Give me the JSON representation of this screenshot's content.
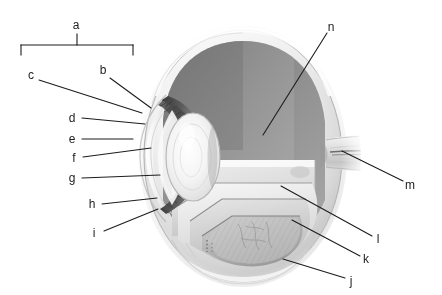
{
  "figure": {
    "style": "grayscale anatomical illustration with lettered leader lines",
    "background_color": "#ffffff",
    "line_color": "#1d1d1d",
    "text_color": "#1d1d1d",
    "width": 442,
    "height": 295
  },
  "bracket": {
    "name": "a",
    "label": "a",
    "label_x": 76,
    "label_y": 25,
    "left_x": 21,
    "right_x": 133,
    "bar_y": 45,
    "tick_depth": 10,
    "stem_top": 34
  },
  "labels": [
    {
      "id": "a",
      "text": "a",
      "x": 76,
      "y": 25
    },
    {
      "id": "b",
      "text": "b",
      "x": 103,
      "y": 70
    },
    {
      "id": "c",
      "text": "c",
      "x": 31,
      "y": 75
    },
    {
      "id": "d",
      "text": "d",
      "x": 72,
      "y": 118
    },
    {
      "id": "e",
      "text": "e",
      "x": 72,
      "y": 139
    },
    {
      "id": "f",
      "text": "f",
      "x": 74,
      "y": 158
    },
    {
      "id": "g",
      "text": "g",
      "x": 72,
      "y": 178
    },
    {
      "id": "h",
      "text": "h",
      "x": 92,
      "y": 204
    },
    {
      "id": "i",
      "text": "i",
      "x": 94,
      "y": 233
    },
    {
      "id": "j",
      "text": "j",
      "x": 351,
      "y": 281
    },
    {
      "id": "k",
      "text": "k",
      "x": 366,
      "y": 259
    },
    {
      "id": "l",
      "text": "l",
      "x": 378,
      "y": 239
    },
    {
      "id": "m",
      "text": "m",
      "x": 410,
      "y": 185
    },
    {
      "id": "n",
      "text": "n",
      "x": 331,
      "y": 27
    }
  ],
  "leader_lines": [
    {
      "id": "b",
      "x1": 110,
      "y1": 78,
      "x2": 151,
      "y2": 108
    },
    {
      "id": "c",
      "x1": 39,
      "y1": 80,
      "x2": 142,
      "y2": 113
    },
    {
      "id": "d",
      "x1": 82,
      "y1": 118,
      "x2": 145,
      "y2": 124
    },
    {
      "id": "e",
      "x1": 82,
      "y1": 139,
      "x2": 133,
      "y2": 139
    },
    {
      "id": "f",
      "x1": 83,
      "y1": 157,
      "x2": 151,
      "y2": 148
    },
    {
      "id": "g",
      "x1": 82,
      "y1": 178,
      "x2": 160,
      "y2": 175
    },
    {
      "id": "h",
      "x1": 102,
      "y1": 204,
      "x2": 157,
      "y2": 198
    },
    {
      "id": "i",
      "x1": 104,
      "y1": 231,
      "x2": 158,
      "y2": 209
    },
    {
      "id": "j",
      "x1": 345,
      "y1": 278,
      "x2": 283,
      "y2": 259
    },
    {
      "id": "k",
      "x1": 360,
      "y1": 256,
      "x2": 292,
      "y2": 220
    },
    {
      "id": "l",
      "x1": 372,
      "y1": 236,
      "x2": 281,
      "y2": 186
    },
    {
      "id": "m",
      "x1": 403,
      "y1": 181,
      "x2": 342,
      "y2": 151
    },
    {
      "id": "n",
      "x1": 327,
      "y1": 33,
      "x2": 263,
      "y2": 135
    }
  ]
}
